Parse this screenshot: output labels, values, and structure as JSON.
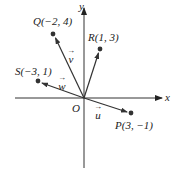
{
  "axes": {
    "x_label": "x",
    "y_label": "y",
    "origin_label": "O"
  },
  "points": [
    {
      "name": "Q",
      "label": "Q(−2, 4)",
      "x": -2,
      "y": 4
    },
    {
      "name": "R",
      "label": "R(1, 3)",
      "x": 1,
      "y": 3
    },
    {
      "name": "S",
      "label": "S(−3, 1)",
      "x": -3,
      "y": 1
    },
    {
      "name": "P",
      "label": "P(3, −1)",
      "x": 3,
      "y": -1
    }
  ],
  "vectors": [
    {
      "name": "v",
      "label": "v",
      "arrow": "→",
      "to": "Q"
    },
    {
      "name": "w",
      "label": "w",
      "arrow": "→",
      "to": "S"
    },
    {
      "name": "u",
      "label": "u",
      "arrow": "→",
      "to": "P"
    },
    {
      "name": "r",
      "label": "",
      "arrow": "",
      "to": "R"
    }
  ],
  "colors": {
    "line": "#333333",
    "dot": "#333333",
    "text": "#222222"
  }
}
